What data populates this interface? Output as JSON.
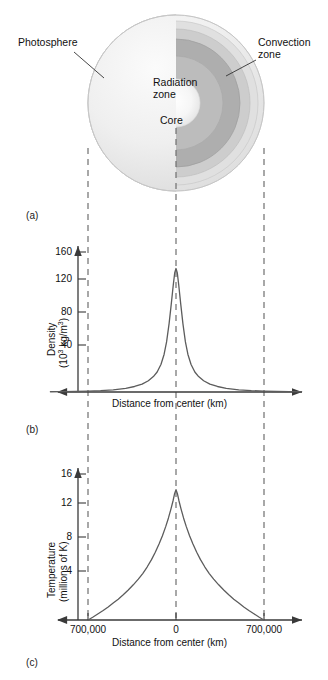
{
  "figure": {
    "panels": [
      {
        "id": "a",
        "label": "(a)"
      },
      {
        "id": "b",
        "label": "(b)"
      },
      {
        "id": "c",
        "label": "(c)"
      }
    ]
  },
  "diagram": {
    "labels": {
      "photosphere": "Photosphere",
      "convection_zone": "Convection\nzone",
      "radiation_zone": "Radiation\nzone",
      "core": "Core"
    },
    "colors": {
      "photosphere": "#ededed",
      "convection_outer": "#d9d9d9",
      "convection_mid": "#c4c4c4",
      "radiation": "#a8a8a8",
      "radiation_inner": "#bdbdbd",
      "core": "#f7f7f7",
      "outline": "#9a9a9a"
    }
  },
  "guides": {
    "dashed_color": "#6f6f6f",
    "positions_km": [
      -700000,
      0,
      700000
    ]
  },
  "chart_data": [
    {
      "type": "line",
      "id": "density",
      "title": "",
      "xlabel": "Distance from center (km)",
      "ylabel": "Density\n(10³ kg/m³)",
      "ylabel_main": "Density",
      "ylabel_unit_pre": "(10",
      "ylabel_unit_sup1": "3",
      "ylabel_unit_mid": " kg/m",
      "ylabel_unit_sup2": "3",
      "ylabel_unit_post": ")",
      "yticks": [
        40,
        80,
        120,
        160
      ],
      "ytick_labels": [
        "40",
        "80",
        "120",
        "160"
      ],
      "ylim": [
        0,
        175
      ],
      "xlim": [
        -1000000,
        1000000
      ],
      "xticks": [
        -700000,
        0,
        700000
      ],
      "xtick_labels": [
        "",
        "",
        ""
      ],
      "grid": false,
      "peak_value": 148,
      "peak_x": 0,
      "x": [
        -1000000,
        -900000,
        -800000,
        -700000,
        -600000,
        -500000,
        -400000,
        -330000,
        -270000,
        -220000,
        -180000,
        -150000,
        -120000,
        -95000,
        -75000,
        -55000,
        -38000,
        -22000,
        -10000,
        0,
        10000,
        22000,
        38000,
        55000,
        75000,
        95000,
        120000,
        150000,
        180000,
        220000,
        270000,
        330000,
        400000,
        500000,
        600000,
        700000,
        800000,
        900000,
        1000000
      ],
      "values": [
        0.3,
        0.4,
        0.6,
        1.0,
        1.6,
        2.6,
        4.4,
        6.6,
        9.5,
        13.5,
        18.5,
        24.0,
        33.0,
        45.0,
        60.0,
        82.0,
        105.0,
        128.0,
        143.0,
        148.0,
        143.0,
        128.0,
        105.0,
        82.0,
        60.0,
        45.0,
        33.0,
        24.0,
        18.5,
        13.5,
        9.5,
        6.6,
        4.4,
        2.6,
        1.6,
        1.0,
        0.6,
        0.4,
        0.3
      ]
    },
    {
      "type": "line",
      "id": "temperature",
      "title": "",
      "xlabel": "Distance from center (km)",
      "ylabel": "Temperature\n(millions of K)",
      "ylabel_main": "Temperature",
      "ylabel_unit": "(millions of K)",
      "yticks": [
        4,
        8,
        12,
        16
      ],
      "ytick_labels": [
        "4",
        "8",
        "12",
        "16"
      ],
      "ylim": [
        0,
        17.5
      ],
      "xlim": [
        -1000000,
        1000000
      ],
      "xticks": [
        -700000,
        0,
        700000
      ],
      "xtick_labels": [
        "700,000",
        "0",
        "700,000"
      ],
      "grid": false,
      "peak_value": 15,
      "peak_x": 0,
      "x": [
        -700000,
        -660000,
        -620000,
        -580000,
        -540000,
        -500000,
        -460000,
        -420000,
        -380000,
        -340000,
        -300000,
        -265000,
        -230000,
        -195000,
        -165000,
        -135000,
        -108000,
        -82000,
        -60000,
        -40000,
        -24000,
        -12000,
        0,
        12000,
        24000,
        40000,
        60000,
        82000,
        108000,
        135000,
        165000,
        195000,
        230000,
        265000,
        300000,
        340000,
        380000,
        420000,
        460000,
        500000,
        540000,
        580000,
        620000,
        660000,
        700000
      ],
      "values": [
        0.0,
        0.35,
        0.72,
        1.1,
        1.5,
        1.95,
        2.4,
        2.9,
        3.45,
        4.05,
        4.7,
        5.35,
        6.1,
        6.95,
        7.8,
        8.75,
        9.7,
        10.75,
        11.75,
        12.8,
        13.7,
        14.5,
        15.0,
        14.5,
        13.7,
        12.8,
        11.75,
        10.75,
        9.7,
        8.75,
        7.8,
        6.95,
        6.1,
        5.35,
        4.7,
        4.05,
        3.45,
        2.9,
        2.4,
        1.95,
        1.5,
        1.1,
        0.72,
        0.35,
        0.0
      ]
    }
  ]
}
